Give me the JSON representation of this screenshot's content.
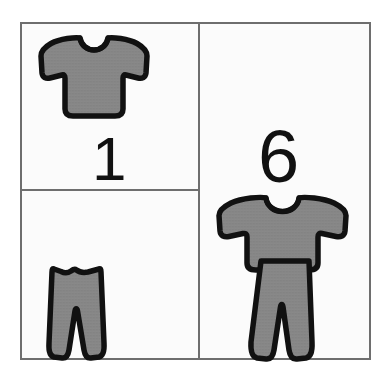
{
  "card": {
    "title": "Clothing quantity card",
    "description": "A three-panel picture card: one shirt and one pair of pants shown separately on the left, and a complete outfit labelled with a total on the right.",
    "background_color": "#ffffff",
    "panel_fill": "#fbfbfb",
    "border_color": "#6e6e6e",
    "garment_fill": "#808080",
    "garment_outline": "#111111",
    "numeral_color": "#111111"
  },
  "panels": [
    {
      "id": "shirt-count",
      "position": "top-left",
      "item": "t-shirt",
      "item_icon": "tshirt-icon",
      "count": "1",
      "count_label": "1"
    },
    {
      "id": "pants-count",
      "position": "bottom-left",
      "item": "pants",
      "item_icon": "pants-icon",
      "count": "",
      "count_label": ""
    },
    {
      "id": "outfit-total",
      "position": "right",
      "item": "outfit",
      "item_icon": "outfit-icon",
      "count": "6",
      "count_label": "6"
    }
  ],
  "numerals": {
    "left_cell_value": "1",
    "right_cell_value": "6"
  },
  "icons": {
    "tshirt_small": "tshirt-icon",
    "pants_small": "pants-icon",
    "outfit_shirt": "tshirt-icon",
    "outfit_pants": "pants-icon"
  }
}
